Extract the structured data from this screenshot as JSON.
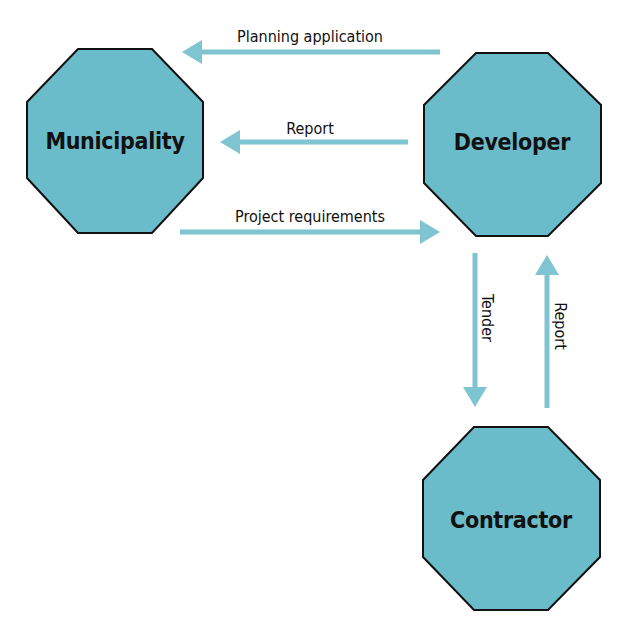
{
  "colors": {
    "node_fill": "#6bbcca",
    "node_stroke": "#111111",
    "arrow": "#7fc4d1",
    "text": "#111111"
  },
  "nodes": [
    {
      "id": "municipality",
      "label": "Municipality",
      "shape": "octagon"
    },
    {
      "id": "developer",
      "label": "Developer",
      "shape": "octagon"
    },
    {
      "id": "contractor",
      "label": "Contractor",
      "shape": "octagon"
    }
  ],
  "edges": [
    {
      "id": "planning-application",
      "from": "developer",
      "to": "municipality",
      "label": "Planning application"
    },
    {
      "id": "report-to-municipality",
      "from": "developer",
      "to": "municipality",
      "label": "Report"
    },
    {
      "id": "project-requirements",
      "from": "municipality",
      "to": "developer",
      "label": "Project requirements"
    },
    {
      "id": "tender",
      "from": "developer",
      "to": "contractor",
      "label": "Tender"
    },
    {
      "id": "report-to-developer",
      "from": "contractor",
      "to": "developer",
      "label": "Report"
    }
  ]
}
